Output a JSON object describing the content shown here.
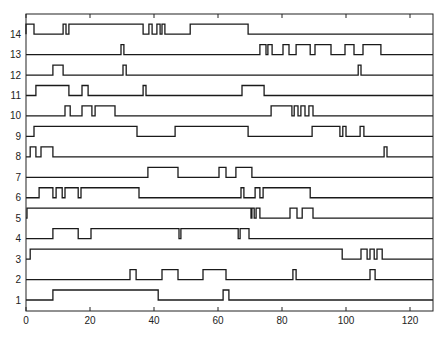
{
  "chart_data": {
    "type": "line",
    "title": "",
    "xlabel": "",
    "ylabel": "",
    "xlim": [
      0,
      128
    ],
    "ylim": [
      0.5,
      14.6
    ],
    "grid": false,
    "legend": null,
    "x_ticks": [
      0,
      20,
      40,
      60,
      80,
      100,
      120
    ],
    "x_tick_labels": [
      "0",
      "20",
      "40",
      "60",
      "80",
      "100",
      "120"
    ],
    "y_ticks": [
      1,
      2,
      3,
      4,
      5,
      6,
      7,
      8,
      9,
      10,
      11,
      12,
      13,
      14
    ],
    "y_tick_labels": [
      "1",
      "2",
      "3",
      "4",
      "5",
      "6",
      "7",
      "8",
      "9",
      "10",
      "11",
      "12",
      "13",
      "14"
    ],
    "series": [
      {
        "name": "1",
        "high_intervals": [
          [
            8.4,
            41.3
          ],
          [
            61.6,
            63.4
          ]
        ]
      },
      {
        "name": "2",
        "high_intervals": [
          [
            32.5,
            34.4
          ],
          [
            42.5,
            47.5
          ],
          [
            55.3,
            62.5
          ],
          [
            83.4,
            84.4
          ],
          [
            107.5,
            109.1
          ]
        ]
      },
      {
        "name": "3",
        "high_intervals": [
          [
            1.3,
            98.8
          ],
          [
            104.7,
            106.6
          ],
          [
            107.5,
            108.8
          ],
          [
            109.7,
            111.3
          ]
        ]
      },
      {
        "name": "4",
        "high_intervals": [
          [
            8.4,
            16.3
          ],
          [
            20.3,
            47.8
          ],
          [
            48.4,
            66.3
          ],
          [
            66.9,
            69.7
          ]
        ]
      },
      {
        "name": "5",
        "high_intervals": [
          [
            0.3,
            70.3
          ],
          [
            70.6,
            71.3
          ],
          [
            71.9,
            73.1
          ],
          [
            82.5,
            84.7
          ],
          [
            86.3,
            89.7
          ]
        ]
      },
      {
        "name": "6",
        "high_intervals": [
          [
            4.1,
            8.4
          ],
          [
            9.4,
            11.3
          ],
          [
            12.2,
            16.3
          ],
          [
            17.2,
            35.3
          ],
          [
            67.2,
            68.1
          ],
          [
            71.6,
            73.1
          ],
          [
            74.1,
            88.8
          ]
        ]
      },
      {
        "name": "7",
        "high_intervals": [
          [
            38.1,
            47.5
          ],
          [
            60.3,
            62.5
          ],
          [
            65.6,
            70.6
          ]
        ]
      },
      {
        "name": "8",
        "high_intervals": [
          [
            1.3,
            3.1
          ],
          [
            4.7,
            8.4
          ],
          [
            111.9,
            112.8
          ]
        ]
      },
      {
        "name": "9",
        "high_intervals": [
          [
            2.5,
            34.7
          ],
          [
            46.6,
            69.4
          ],
          [
            89.4,
            98.1
          ],
          [
            99.0,
            100.0
          ],
          [
            104.4,
            105.6
          ]
        ]
      },
      {
        "name": "10",
        "high_intervals": [
          [
            12.2,
            13.8
          ],
          [
            17.5,
            20.6
          ],
          [
            21.6,
            27.8
          ],
          [
            76.6,
            83.1
          ],
          [
            83.8,
            85.0
          ],
          [
            85.9,
            87.2
          ],
          [
            88.4,
            89.7
          ]
        ]
      },
      {
        "name": "11",
        "high_intervals": [
          [
            3.1,
            13.4
          ],
          [
            17.5,
            19.4
          ],
          [
            36.6,
            37.5
          ],
          [
            67.5,
            74.4
          ]
        ]
      },
      {
        "name": "12",
        "high_intervals": [
          [
            8.4,
            11.6
          ],
          [
            30.3,
            31.3
          ],
          [
            103.8,
            104.7
          ]
        ]
      },
      {
        "name": "13",
        "high_intervals": [
          [
            29.7,
            30.6
          ],
          [
            73.1,
            75.0
          ],
          [
            75.6,
            76.9
          ],
          [
            80.3,
            82.2
          ],
          [
            84.4,
            88.8
          ],
          [
            90.3,
            95.3
          ],
          [
            99.7,
            102.5
          ],
          [
            105.3,
            110.9
          ]
        ]
      },
      {
        "name": "14",
        "high_intervals": [
          [
            0.0,
            2.5
          ],
          [
            11.6,
            12.5
          ],
          [
            13.4,
            36.6
          ],
          [
            38.4,
            39.4
          ],
          [
            40.9,
            41.9
          ],
          [
            42.5,
            43.4
          ],
          [
            51.3,
            69.4
          ]
        ]
      }
    ]
  },
  "layout": {
    "plot_left_px": 26,
    "plot_right_px": 433,
    "plot_top_px": 14,
    "plot_bottom_px": 311,
    "px_per_unit": 3.2,
    "row1_baseline_px": 300,
    "row_spacing_px": 20.45,
    "pulse_height_px": 10,
    "line_color": "#1a1a1a"
  }
}
